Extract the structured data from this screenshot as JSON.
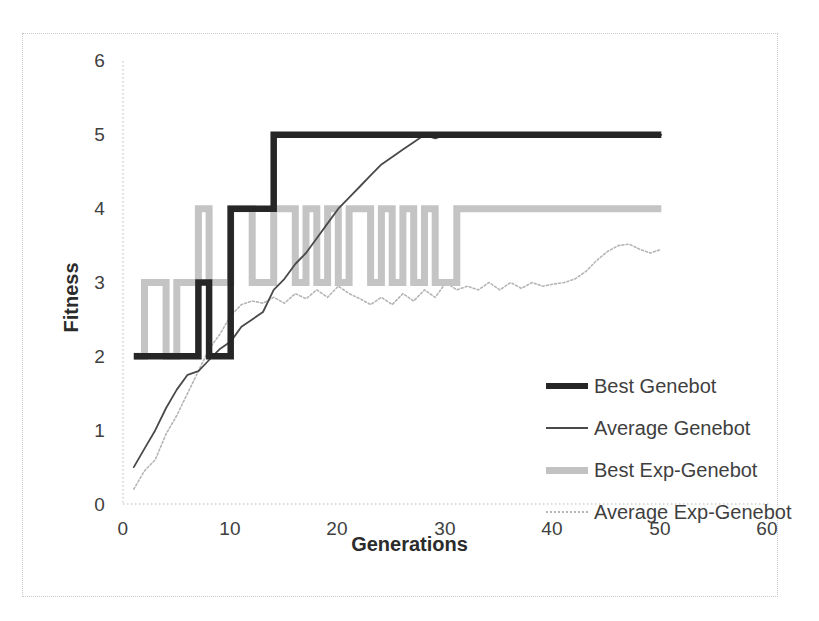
{
  "chart_data": {
    "type": "line",
    "title": "",
    "xlabel": "Generations",
    "ylabel": "Fitness",
    "xlim": [
      0,
      60
    ],
    "ylim": [
      0,
      6
    ],
    "xticks": [
      "0",
      "10",
      "20",
      "30",
      "40",
      "50",
      "60"
    ],
    "yticks": [
      "0",
      "1",
      "2",
      "3",
      "4",
      "5",
      "6"
    ],
    "grid": false,
    "legend_position": "center-right",
    "colors": {
      "best_genebot": "#262626",
      "average_genebot": "#4a4a4a",
      "best_exp_genebot": "#c2c2c2",
      "average_exp_genebot": "#b5b5b5",
      "frame": "#c9c9c9",
      "background": "#ffffff"
    },
    "series": [
      {
        "name": "Best Genebot",
        "style": "thick-solid-black",
        "x": [
          1,
          2,
          3,
          4,
          5,
          6,
          7,
          8,
          9,
          10,
          11,
          12,
          13,
          14,
          15,
          16,
          17,
          18,
          19,
          20,
          25,
          30,
          35,
          40,
          45,
          50
        ],
        "values": [
          2,
          2,
          2,
          2,
          2,
          2,
          3,
          2,
          2,
          4,
          4,
          4,
          4,
          5,
          5,
          5,
          5,
          5,
          5,
          5,
          5,
          5,
          5,
          5,
          5,
          5
        ]
      },
      {
        "name": "Average Genebot",
        "style": "thin-solid-black",
        "x": [
          1,
          2,
          3,
          4,
          5,
          6,
          7,
          8,
          9,
          10,
          11,
          12,
          13,
          14,
          15,
          16,
          17,
          18,
          19,
          20,
          21,
          22,
          23,
          24,
          25,
          26,
          27,
          28,
          29,
          30,
          31,
          32,
          35,
          40,
          45,
          50
        ],
        "values": [
          0.5,
          0.75,
          1.0,
          1.3,
          1.55,
          1.75,
          1.8,
          1.95,
          2.1,
          2.2,
          2.4,
          2.5,
          2.6,
          2.9,
          3.05,
          3.25,
          3.4,
          3.6,
          3.8,
          4.0,
          4.15,
          4.3,
          4.45,
          4.6,
          4.7,
          4.8,
          4.9,
          5.0,
          4.95,
          5.0,
          5.0,
          5.0,
          5.0,
          5.0,
          5.0,
          5.0
        ]
      },
      {
        "name": "Best Exp-Genebot",
        "style": "thick-solid-gray",
        "x": [
          1,
          2,
          3,
          4,
          5,
          6,
          7,
          8,
          9,
          10,
          11,
          12,
          13,
          14,
          15,
          16,
          17,
          18,
          19,
          20,
          21,
          22,
          23,
          24,
          25,
          26,
          27,
          28,
          29,
          30,
          31,
          32,
          35,
          40,
          45,
          50
        ],
        "values": [
          2,
          3,
          3,
          2,
          3,
          3,
          4,
          3,
          3,
          4,
          4,
          3,
          3,
          4,
          4,
          3,
          4,
          3,
          4,
          3,
          4,
          4,
          3,
          4,
          3,
          4,
          3,
          4,
          3,
          3,
          4,
          4,
          4,
          4,
          4,
          4
        ]
      },
      {
        "name": "Average Exp-Genebot",
        "style": "thin-dotted-gray",
        "x": [
          1,
          2,
          3,
          4,
          5,
          6,
          7,
          8,
          9,
          10,
          11,
          12,
          13,
          14,
          15,
          16,
          17,
          18,
          19,
          20,
          21,
          22,
          23,
          24,
          25,
          26,
          27,
          28,
          29,
          30,
          31,
          32,
          33,
          34,
          35,
          36,
          37,
          38,
          39,
          40,
          41,
          42,
          43,
          44,
          45,
          46,
          47,
          48,
          49,
          50
        ],
        "values": [
          0.2,
          0.45,
          0.6,
          0.95,
          1.2,
          1.5,
          1.8,
          2.1,
          2.3,
          2.55,
          2.7,
          2.75,
          2.72,
          2.8,
          2.72,
          2.85,
          2.78,
          2.9,
          2.8,
          2.95,
          2.85,
          2.78,
          2.7,
          2.8,
          2.7,
          2.85,
          2.75,
          2.9,
          2.8,
          3.0,
          2.9,
          2.95,
          2.9,
          3.0,
          2.9,
          3.0,
          2.92,
          3.0,
          2.95,
          2.98,
          3.0,
          3.05,
          3.15,
          3.3,
          3.42,
          3.5,
          3.52,
          3.45,
          3.4,
          3.45
        ]
      }
    ]
  },
  "axes": {
    "ylabel": "Fitness",
    "xlabel": "Generations",
    "yticks": [
      "6",
      "5",
      "4",
      "3",
      "2",
      "1",
      "0"
    ],
    "xticks": [
      "0",
      "10",
      "20",
      "30",
      "40",
      "50",
      "60"
    ]
  },
  "legend": {
    "items": [
      {
        "label": "Best Genebot"
      },
      {
        "label": "Average Genebot"
      },
      {
        "label": "Best Exp-Genebot"
      },
      {
        "label": "Average Exp-Genebot"
      }
    ]
  }
}
